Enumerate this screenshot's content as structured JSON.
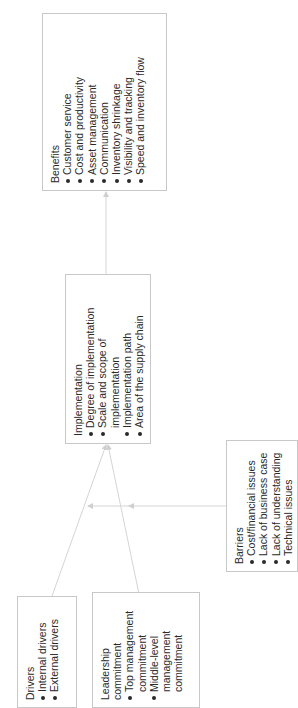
{
  "diagram": {
    "benefits": {
      "title": "Benefits",
      "items": [
        "Customer service",
        "Cost and productivity",
        "Asset management",
        "Communication",
        "Inventory shrinkage",
        "Visibility and tracking",
        "Speed and inventory flow"
      ]
    },
    "implementation": {
      "title": "Implementation",
      "items": [
        "Degree of implementation",
        "Scale and scope of implementation",
        "Implementation path",
        "Area of the supply chain"
      ]
    },
    "barriers": {
      "title": "Barriers",
      "items": [
        "Cost/financial issues",
        "Lack of business case",
        "Lack of understanding",
        "Technical issues"
      ]
    },
    "drivers": {
      "title": "Drivers",
      "items": [
        "Internal drivers",
        "External drivers"
      ]
    },
    "leadership": {
      "title": "Leadership commitment",
      "items": [
        "Top management commitment",
        "Middle-level management commitment"
      ]
    },
    "colors": {
      "line": "#d0d0d0",
      "border": "#c8c8c8",
      "text": "#2a2a2a"
    }
  }
}
